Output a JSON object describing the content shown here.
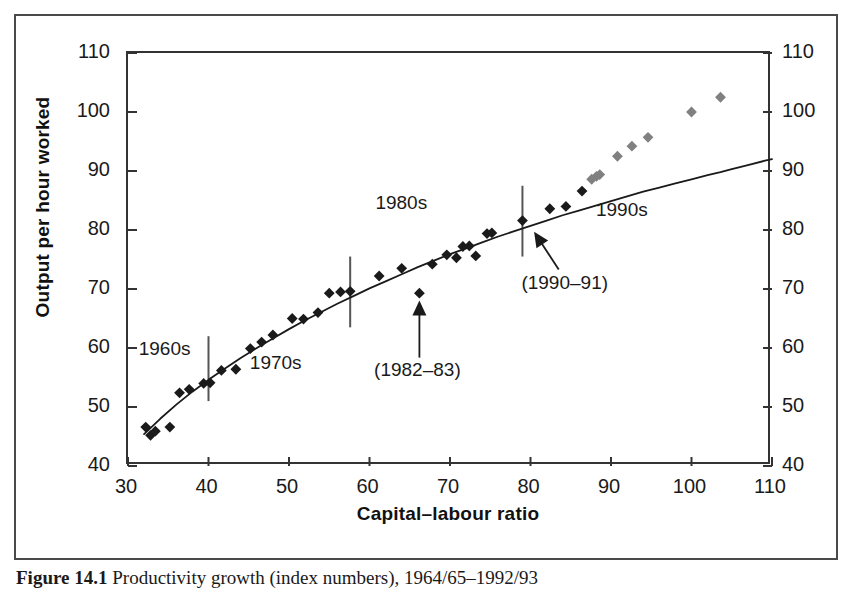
{
  "figure": {
    "caption_label": "Figure 14.1",
    "caption_text": "Productivity growth (index numbers), 1964/65–1992/93"
  },
  "chart_data": {
    "type": "scatter",
    "title": "",
    "xlabel": "Capital–labour ratio",
    "ylabel": "Output per hour worked",
    "xlim": [
      30,
      110
    ],
    "ylim": [
      40,
      110
    ],
    "xticks": [
      30,
      40,
      50,
      60,
      70,
      80,
      90,
      100,
      110
    ],
    "yticks": [
      40,
      50,
      60,
      70,
      80,
      90,
      100,
      110
    ],
    "yticks_right": [
      40,
      50,
      60,
      70,
      80,
      90,
      100,
      110
    ],
    "grid": false,
    "legend": "none",
    "marker": "diamond",
    "colors": {
      "series_early": "#1a1a1a",
      "series_1990s": "#808080",
      "fit_curve": "#1a1a1a",
      "divider": "#555555",
      "axis": "#333333",
      "frame": "#4a4a4a"
    },
    "series": [
      {
        "name": "1960s–1980s",
        "color": "#1a1a1a",
        "points": [
          [
            32.2,
            46.6
          ],
          [
            32.8,
            45.2
          ],
          [
            33.4,
            45.9
          ],
          [
            35.2,
            46.6
          ],
          [
            36.4,
            52.4
          ],
          [
            37.6,
            53.0
          ],
          [
            39.4,
            54.0
          ],
          [
            40.2,
            54.1
          ],
          [
            41.6,
            56.2
          ],
          [
            43.4,
            56.4
          ],
          [
            45.2,
            59.9
          ],
          [
            46.6,
            61.0
          ],
          [
            48.0,
            62.2
          ],
          [
            50.4,
            65.0
          ],
          [
            51.8,
            64.9
          ],
          [
            53.6,
            66.0
          ],
          [
            55.0,
            69.3
          ],
          [
            56.4,
            69.5
          ],
          [
            57.6,
            69.6
          ],
          [
            61.2,
            72.2
          ],
          [
            64.0,
            73.5
          ],
          [
            66.2,
            69.3
          ],
          [
            67.8,
            74.2
          ],
          [
            69.6,
            75.8
          ],
          [
            70.8,
            75.3
          ],
          [
            71.6,
            77.2
          ],
          [
            72.4,
            77.3
          ],
          [
            73.2,
            75.6
          ],
          [
            74.6,
            79.4
          ],
          [
            75.2,
            79.5
          ],
          [
            79.0,
            81.6
          ],
          [
            82.4,
            83.6
          ],
          [
            84.4,
            84.0
          ],
          [
            86.4,
            86.6
          ]
        ]
      },
      {
        "name": "1990s",
        "color": "#808080",
        "points": [
          [
            87.6,
            88.6
          ],
          [
            88.2,
            89.1
          ],
          [
            88.6,
            89.4
          ],
          [
            90.8,
            92.5
          ],
          [
            92.6,
            94.2
          ],
          [
            94.6,
            95.7
          ],
          [
            100.0,
            100.0
          ],
          [
            103.6,
            102.5
          ]
        ]
      }
    ],
    "fit_curve": {
      "name": "fitted production function",
      "color": "#1a1a1a",
      "points": [
        [
          32.0,
          45.4
        ],
        [
          34.0,
          48.0
        ],
        [
          36.0,
          50.4
        ],
        [
          38.0,
          52.6
        ],
        [
          40.0,
          54.6
        ],
        [
          42.0,
          56.5
        ],
        [
          44.0,
          58.3
        ],
        [
          46.0,
          60.0
        ],
        [
          48.0,
          61.6
        ],
        [
          50.0,
          63.2
        ],
        [
          52.0,
          64.7
        ],
        [
          54.0,
          66.1
        ],
        [
          56.0,
          67.5
        ],
        [
          58.0,
          68.8
        ],
        [
          60.0,
          70.1
        ],
        [
          62.0,
          71.3
        ],
        [
          64.0,
          72.5
        ],
        [
          66.0,
          73.7
        ],
        [
          68.0,
          74.8
        ],
        [
          70.0,
          75.9
        ],
        [
          72.0,
          76.9
        ],
        [
          74.0,
          77.9
        ],
        [
          76.0,
          78.9
        ],
        [
          78.0,
          79.8
        ],
        [
          80.0,
          80.7
        ],
        [
          82.0,
          81.6
        ],
        [
          84.0,
          82.5
        ],
        [
          86.0,
          83.3
        ],
        [
          88.0,
          84.1
        ],
        [
          90.0,
          84.9
        ],
        [
          92.0,
          85.7
        ],
        [
          94.0,
          86.5
        ],
        [
          96.0,
          87.2
        ],
        [
          98.0,
          87.9
        ],
        [
          100.0,
          88.6
        ],
        [
          102.0,
          89.3
        ],
        [
          103.6,
          89.8
        ],
        [
          105.0,
          90.3
        ],
        [
          107.0,
          91.0
        ],
        [
          109.0,
          91.7
        ],
        [
          110.0,
          92.0
        ]
      ]
    },
    "dividers": [
      {
        "name": "1960s-1970s-divider",
        "x": 40.0,
        "y_bottom": 51.0,
        "y_top": 62.0
      },
      {
        "name": "1970s-1980s-divider",
        "x": 57.6,
        "y_bottom": 63.5,
        "y_top": 75.5
      },
      {
        "name": "1980s-1990s-divider",
        "x": 79.0,
        "y_bottom": 75.5,
        "y_top": 87.5
      }
    ],
    "era_labels": [
      {
        "name": "1960s",
        "text": "1960s",
        "x": 34.8,
        "y": 59.5
      },
      {
        "name": "1970s",
        "text": "1970s",
        "x": 48.6,
        "y": 57.2
      },
      {
        "name": "1980s",
        "text": "1980s",
        "x": 64.2,
        "y": 84.2
      },
      {
        "name": "1990s",
        "text": "1990s",
        "x": 91.6,
        "y": 83.0
      }
    ],
    "annotations": [
      {
        "name": "recession-1982-83",
        "text": "(1982–83)",
        "label_x": 66.2,
        "label_y": 56.0,
        "target_x": 66.2,
        "target_y": 68.4,
        "arrow": "up"
      },
      {
        "name": "recession-1990-91",
        "text": "(1990–91)",
        "label_x": 84.5,
        "label_y": 70.6,
        "target_x": 79.7,
        "target_y": 80.7,
        "arrow": "diagonal-up-left"
      }
    ]
  }
}
